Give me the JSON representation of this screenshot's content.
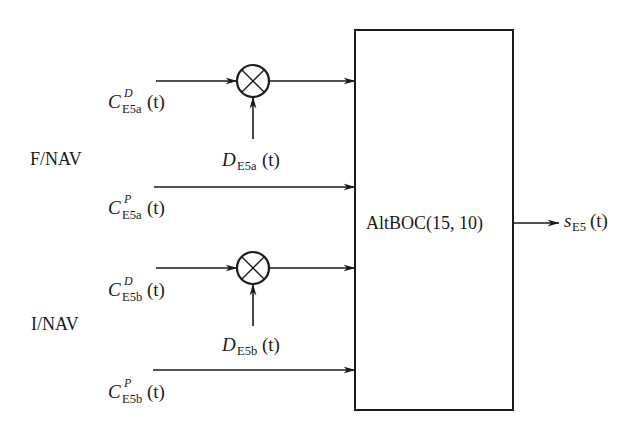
{
  "diagram": {
    "groups": [
      {
        "label": "F/NAV"
      },
      {
        "label": "I/NAV"
      }
    ],
    "signals": {
      "c_e5a_d": {
        "symbol": "C",
        "sup": "D",
        "sub": "E5a",
        "arg": "(t)"
      },
      "d_e5a": {
        "symbol": "D",
        "sub": "E5a",
        "arg": "(t)"
      },
      "c_e5a_p": {
        "symbol": "C",
        "sup": "P",
        "sub": "E5a",
        "arg": "(t)"
      },
      "c_e5b_d": {
        "symbol": "C",
        "sup": "D",
        "sub": "E5b",
        "arg": "(t)"
      },
      "d_e5b": {
        "symbol": "D",
        "sub": "E5b",
        "arg": "(t)"
      },
      "c_e5b_p": {
        "symbol": "C",
        "sup": "P",
        "sub": "E5b",
        "arg": "(t)"
      },
      "s_e5": {
        "symbol": "s",
        "sub": "E5",
        "arg": "(t)"
      }
    },
    "block": {
      "label": "AltBOC(15, 10)"
    },
    "multipliers": [
      {
        "symbol": "multiply-circle"
      },
      {
        "symbol": "multiply-circle"
      }
    ]
  }
}
